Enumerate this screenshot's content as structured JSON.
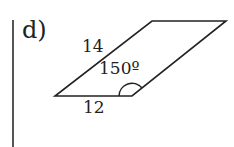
{
  "problem": {
    "part_label": "d)",
    "shape": "parallelogram",
    "sides": {
      "slanted_side_label": "14",
      "base_label": "12"
    },
    "angle": {
      "label": "150º",
      "vertex": "bottom-right interior angle"
    }
  },
  "colors": {
    "stroke": "#222222",
    "divider": "#555555",
    "background": "#ffffff"
  }
}
